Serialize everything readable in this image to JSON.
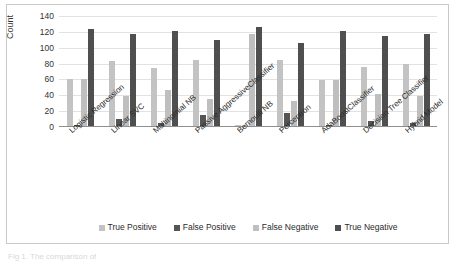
{
  "figure": {
    "caption": "Fig 1. The comparison of"
  },
  "chart_data": {
    "type": "bar",
    "title": "",
    "xlabel": "",
    "ylabel": "Count",
    "ylim": [
      0,
      140
    ],
    "yticks": [
      0,
      20,
      40,
      60,
      80,
      100,
      120,
      140
    ],
    "grid": true,
    "legend_position": "bottom",
    "categories": [
      "Logistic Regression",
      "Linear SVC",
      "Multinomial NB",
      "Passive AggressiveClassifier",
      "Bernoulli NB",
      "Perceptron",
      "AdaBoostClassifier",
      "Decision Tree Classifier",
      "Hybrid Model"
    ],
    "series": [
      {
        "name": "True Positive",
        "color": "#c3c3c3",
        "values": [
          61,
          83,
          74,
          85,
          3,
          85,
          59,
          76,
          79
        ]
      },
      {
        "name": "False Positive",
        "color": "#555555",
        "values": [
          3,
          10,
          5,
          15,
          1,
          18,
          3,
          8,
          5
        ]
      },
      {
        "name": "False Negative",
        "color": "#bfbfbf",
        "values": [
          61,
          39,
          47,
          35,
          117,
          33,
          59,
          42,
          39
        ]
      },
      {
        "name": "True Negative",
        "color": "#4f4f4f",
        "values": [
          124,
          117,
          121,
          110,
          126,
          106,
          121,
          115,
          117
        ]
      }
    ]
  }
}
